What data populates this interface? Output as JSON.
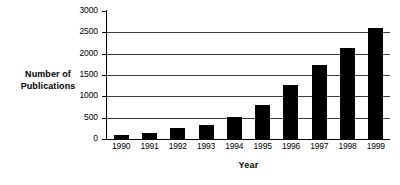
{
  "chart_data": {
    "type": "bar",
    "title": "",
    "xlabel": "Year",
    "ylabel": "Number of\nPublications",
    "ylabel_line1": "Number of",
    "ylabel_line2": "Publications",
    "categories": [
      "1990",
      "1991",
      "1992",
      "1993",
      "1994",
      "1995",
      "1996",
      "1997",
      "1998",
      "1999"
    ],
    "values": [
      100,
      130,
      265,
      320,
      510,
      790,
      1255,
      1730,
      2135,
      2600
    ],
    "ylim": [
      0,
      3000
    ],
    "yticks": [
      0,
      500,
      1000,
      1500,
      2000,
      2500,
      3000
    ],
    "ytick_labels": [
      "0",
      "500",
      "1000",
      "1500",
      "2000",
      "2500",
      "3000"
    ],
    "grid": "horizontal",
    "legend": "none",
    "bar_color": "#000000",
    "axis_color": "#000000",
    "grid_color": "#3a3a3a",
    "background_color": "#ffffff"
  }
}
